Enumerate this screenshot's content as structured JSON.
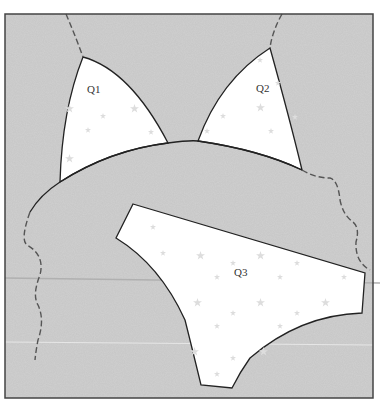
{
  "diagram": {
    "pieces": [
      {
        "id": "q1",
        "label": "Q1"
      },
      {
        "id": "q2",
        "label": "Q2"
      },
      {
        "id": "q3",
        "label": "Q3"
      }
    ],
    "colors": {
      "background": "#c4c4c4",
      "piece_fill": "#ffffff",
      "outline": "#222222",
      "dash_line": "#555555",
      "frame": "#444444",
      "star": "#dddddd"
    }
  }
}
